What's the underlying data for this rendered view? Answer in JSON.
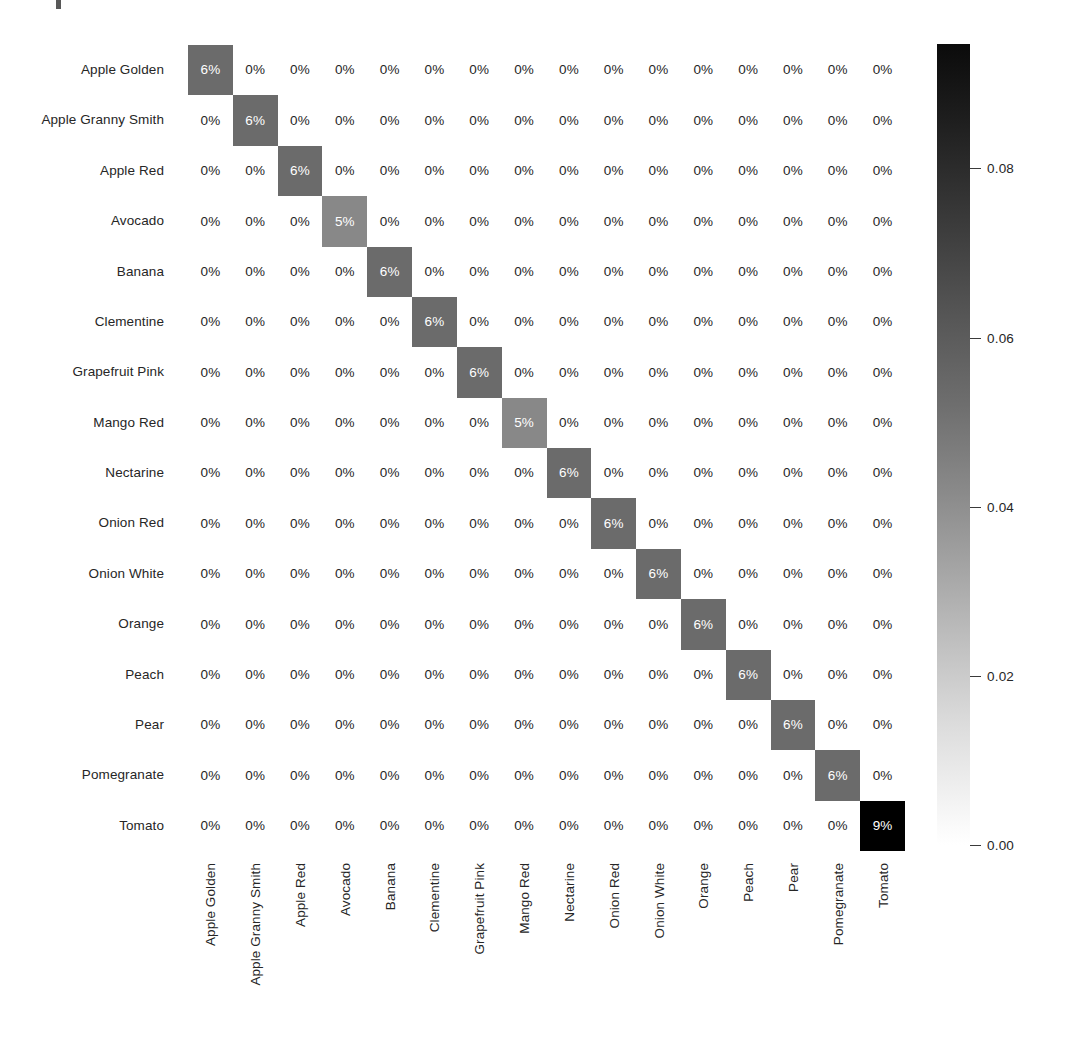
{
  "chart_data": {
    "type": "heatmap",
    "title": "",
    "xlabel": "",
    "ylabel": "",
    "colormap": "Greys",
    "grid": false,
    "legend_position": "right-colorbar",
    "value_format": "percent-rounded",
    "colorbar": {
      "ticks": [
        "0.08",
        "0.06",
        "0.04",
        "0.02",
        "0.00"
      ],
      "tick_values": [
        0.08,
        0.06,
        0.04,
        0.02,
        0.0
      ],
      "vmin": 0.0,
      "vmax": 0.0947,
      "orientation": "vertical"
    },
    "categories": [
      "Apple Golden",
      "Apple Granny Smith",
      "Apple Red",
      "Avocado",
      "Banana",
      "Clementine",
      "Grapefruit Pink",
      "Mango Red",
      "Nectarine",
      "Onion Red",
      "Onion White",
      "Orange",
      "Peach",
      "Pear",
      "Pomegranate",
      "Tomato"
    ],
    "x_categories": [
      "Apple Golden",
      "Apple Granny Smith",
      "Apple Red",
      "Avocado",
      "Banana",
      "Clementine",
      "Grapefruit Pink",
      "Mango Red",
      "Nectarine",
      "Onion Red",
      "Onion White",
      "Orange",
      "Peach",
      "Pear",
      "Pomegranate",
      "Tomato"
    ],
    "y_categories": [
      "Apple Golden",
      "Apple Granny Smith",
      "Apple Red",
      "Avocado",
      "Banana",
      "Clementine",
      "Grapefruit Pink",
      "Mango Red",
      "Nectarine",
      "Onion Red",
      "Onion White",
      "Orange",
      "Peach",
      "Pear",
      "Pomegranate",
      "Tomato"
    ],
    "diagonal_values": [
      0.062,
      0.062,
      0.062,
      0.052,
      0.062,
      0.062,
      0.062,
      0.052,
      0.062,
      0.062,
      0.062,
      0.062,
      0.062,
      0.062,
      0.062,
      0.0947
    ],
    "cell_labels": [
      [
        "6%",
        "0%",
        "0%",
        "0%",
        "0%",
        "0%",
        "0%",
        "0%",
        "0%",
        "0%",
        "0%",
        "0%",
        "0%",
        "0%",
        "0%",
        "0%"
      ],
      [
        "0%",
        "6%",
        "0%",
        "0%",
        "0%",
        "0%",
        "0%",
        "0%",
        "0%",
        "0%",
        "0%",
        "0%",
        "0%",
        "0%",
        "0%",
        "0%"
      ],
      [
        "0%",
        "0%",
        "6%",
        "0%",
        "0%",
        "0%",
        "0%",
        "0%",
        "0%",
        "0%",
        "0%",
        "0%",
        "0%",
        "0%",
        "0%",
        "0%"
      ],
      [
        "0%",
        "0%",
        "0%",
        "5%",
        "0%",
        "0%",
        "0%",
        "0%",
        "0%",
        "0%",
        "0%",
        "0%",
        "0%",
        "0%",
        "0%",
        "0%"
      ],
      [
        "0%",
        "0%",
        "0%",
        "0%",
        "6%",
        "0%",
        "0%",
        "0%",
        "0%",
        "0%",
        "0%",
        "0%",
        "0%",
        "0%",
        "0%",
        "0%"
      ],
      [
        "0%",
        "0%",
        "0%",
        "0%",
        "0%",
        "6%",
        "0%",
        "0%",
        "0%",
        "0%",
        "0%",
        "0%",
        "0%",
        "0%",
        "0%",
        "0%"
      ],
      [
        "0%",
        "0%",
        "0%",
        "0%",
        "0%",
        "0%",
        "6%",
        "0%",
        "0%",
        "0%",
        "0%",
        "0%",
        "0%",
        "0%",
        "0%",
        "0%"
      ],
      [
        "0%",
        "0%",
        "0%",
        "0%",
        "0%",
        "0%",
        "0%",
        "5%",
        "0%",
        "0%",
        "0%",
        "0%",
        "0%",
        "0%",
        "0%",
        "0%"
      ],
      [
        "0%",
        "0%",
        "0%",
        "0%",
        "0%",
        "0%",
        "0%",
        "0%",
        "6%",
        "0%",
        "0%",
        "0%",
        "0%",
        "0%",
        "0%",
        "0%"
      ],
      [
        "0%",
        "0%",
        "0%",
        "0%",
        "0%",
        "0%",
        "0%",
        "0%",
        "0%",
        "6%",
        "0%",
        "0%",
        "0%",
        "0%",
        "0%",
        "0%"
      ],
      [
        "0%",
        "0%",
        "0%",
        "0%",
        "0%",
        "0%",
        "0%",
        "0%",
        "0%",
        "0%",
        "6%",
        "0%",
        "0%",
        "0%",
        "0%",
        "0%"
      ],
      [
        "0%",
        "0%",
        "0%",
        "0%",
        "0%",
        "0%",
        "0%",
        "0%",
        "0%",
        "0%",
        "0%",
        "6%",
        "0%",
        "0%",
        "0%",
        "0%"
      ],
      [
        "0%",
        "0%",
        "0%",
        "0%",
        "0%",
        "0%",
        "0%",
        "0%",
        "0%",
        "0%",
        "0%",
        "0%",
        "6%",
        "0%",
        "0%",
        "0%"
      ],
      [
        "0%",
        "0%",
        "0%",
        "0%",
        "0%",
        "0%",
        "0%",
        "0%",
        "0%",
        "0%",
        "0%",
        "0%",
        "0%",
        "6%",
        "0%",
        "0%"
      ],
      [
        "0%",
        "0%",
        "0%",
        "0%",
        "0%",
        "0%",
        "0%",
        "0%",
        "0%",
        "0%",
        "0%",
        "0%",
        "0%",
        "0%",
        "6%",
        "0%"
      ],
      [
        "0%",
        "0%",
        "0%",
        "0%",
        "0%",
        "0%",
        "0%",
        "0%",
        "0%",
        "0%",
        "0%",
        "0%",
        "0%",
        "0%",
        "0%",
        "9%"
      ]
    ],
    "values": [
      [
        0.062,
        0,
        0,
        0,
        0,
        0,
        0,
        0,
        0,
        0,
        0,
        0,
        0,
        0,
        0,
        0
      ],
      [
        0,
        0.062,
        0,
        0,
        0,
        0,
        0,
        0,
        0,
        0,
        0,
        0,
        0,
        0,
        0,
        0
      ],
      [
        0,
        0,
        0.062,
        0,
        0,
        0,
        0,
        0,
        0,
        0,
        0,
        0,
        0,
        0,
        0,
        0
      ],
      [
        0,
        0,
        0,
        0.052,
        0,
        0,
        0,
        0,
        0,
        0,
        0,
        0,
        0,
        0,
        0,
        0
      ],
      [
        0,
        0,
        0,
        0,
        0.062,
        0,
        0,
        0,
        0,
        0,
        0,
        0,
        0,
        0,
        0,
        0
      ],
      [
        0,
        0,
        0,
        0,
        0,
        0.062,
        0,
        0,
        0,
        0,
        0,
        0,
        0,
        0,
        0,
        0
      ],
      [
        0,
        0,
        0,
        0,
        0,
        0,
        0.062,
        0,
        0,
        0,
        0,
        0,
        0,
        0,
        0,
        0
      ],
      [
        0,
        0,
        0,
        0,
        0,
        0,
        0,
        0.052,
        0,
        0,
        0,
        0,
        0,
        0,
        0,
        0
      ],
      [
        0,
        0,
        0,
        0,
        0,
        0,
        0,
        0,
        0.062,
        0,
        0,
        0,
        0,
        0,
        0,
        0
      ],
      [
        0,
        0,
        0,
        0,
        0,
        0,
        0,
        0,
        0,
        0.062,
        0,
        0,
        0,
        0,
        0,
        0
      ],
      [
        0,
        0,
        0,
        0,
        0,
        0,
        0,
        0,
        0,
        0,
        0.062,
        0,
        0,
        0,
        0,
        0
      ],
      [
        0,
        0,
        0,
        0,
        0,
        0,
        0,
        0,
        0,
        0,
        0,
        0.062,
        0,
        0,
        0,
        0
      ],
      [
        0,
        0,
        0,
        0,
        0,
        0,
        0,
        0,
        0,
        0,
        0,
        0,
        0.062,
        0,
        0,
        0
      ],
      [
        0,
        0,
        0,
        0,
        0,
        0,
        0,
        0,
        0,
        0,
        0,
        0,
        0,
        0.062,
        0,
        0
      ],
      [
        0,
        0,
        0,
        0,
        0,
        0,
        0,
        0,
        0,
        0,
        0,
        0,
        0,
        0,
        0.062,
        0
      ],
      [
        0,
        0,
        0,
        0,
        0,
        0,
        0,
        0,
        0,
        0,
        0,
        0,
        0,
        0,
        0,
        0.0947
      ]
    ],
    "cell_colors": [
      "#ffffff",
      "#7c7c7c",
      "#6e6e6e",
      "#171717"
    ]
  },
  "colors": {
    "background": "#ffffff",
    "text": "#262626",
    "cell_text_light": "#ffffff",
    "diagonal_mid": "#6e6e6e",
    "diagonal_low": "#7c7c7c",
    "diagonal_max": "#171717"
  }
}
